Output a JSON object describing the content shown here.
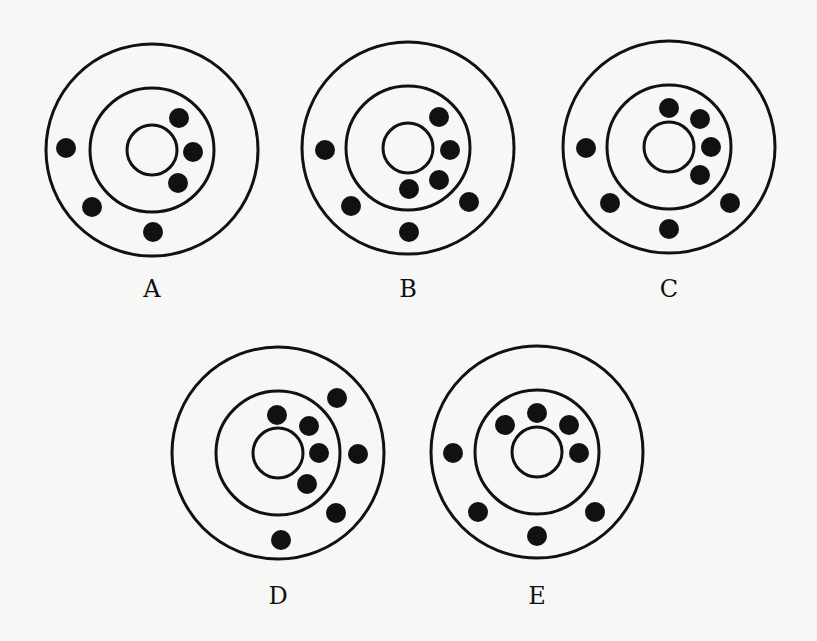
{
  "figure": {
    "colors": {
      "background": "#f7f7f5",
      "stroke": "#111111",
      "electron": "#111111"
    },
    "diagrams": [
      {
        "label": "A",
        "center": [
          152,
          150
        ],
        "radii": [
          25,
          62,
          106
        ],
        "electrons": [
          [
            179,
            118
          ],
          [
            193,
            152
          ],
          [
            178,
            183
          ],
          [
            66,
            148
          ],
          [
            92,
            207
          ],
          [
            153,
            232
          ]
        ]
      },
      {
        "label": "B",
        "center": [
          408,
          148
        ],
        "radii": [
          25,
          62,
          106
        ],
        "electrons": [
          [
            439,
            117
          ],
          [
            450,
            150
          ],
          [
            439,
            180
          ],
          [
            409,
            189
          ],
          [
            325,
            150
          ],
          [
            351,
            206
          ],
          [
            409,
            232
          ],
          [
            469,
            202
          ]
        ]
      },
      {
        "label": "C",
        "center": [
          669,
          147
        ],
        "radii": [
          25,
          62,
          106
        ],
        "electrons": [
          [
            669,
            108
          ],
          [
            700,
            119
          ],
          [
            711,
            147
          ],
          [
            700,
            175
          ],
          [
            586,
            148
          ],
          [
            610,
            203
          ],
          [
            669,
            229
          ],
          [
            730,
            203
          ]
        ]
      },
      {
        "label": "D",
        "center": [
          278,
          453
        ],
        "radii": [
          25,
          62,
          106
        ],
        "electrons": [
          [
            277,
            415
          ],
          [
            309,
            426
          ],
          [
            319,
            453
          ],
          [
            307,
            484
          ],
          [
            337,
            398
          ],
          [
            358,
            454
          ],
          [
            336,
            513
          ],
          [
            281,
            540
          ]
        ]
      },
      {
        "label": "E",
        "center": [
          537,
          452
        ],
        "radii": [
          25,
          62,
          106
        ],
        "electrons": [
          [
            537,
            413
          ],
          [
            505,
            425
          ],
          [
            569,
            425
          ],
          [
            579,
            453
          ],
          [
            453,
            453
          ],
          [
            478,
            512
          ],
          [
            537,
            536
          ],
          [
            595,
            512
          ]
        ]
      }
    ],
    "label_positions": [
      [
        152,
        293
      ],
      [
        408,
        293
      ],
      [
        669,
        293
      ],
      [
        278,
        600
      ],
      [
        537,
        600
      ]
    ]
  }
}
